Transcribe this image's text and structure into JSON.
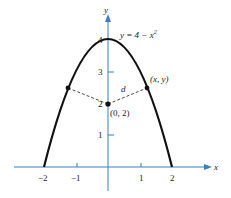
{
  "diagram": {
    "equation_label": "y = 4 − x²",
    "equation_parts": {
      "lhs": "y = 4 − x",
      "exp": "2"
    },
    "axes": {
      "x_label": "x",
      "y_label": "y",
      "x_ticks": [
        "−2",
        "−1",
        "1",
        "2"
      ],
      "y_ticks": [
        "1",
        "2",
        "3",
        "4"
      ]
    },
    "points": {
      "center_label": "(0, 2)",
      "curve_point_label": "(x, y)",
      "distance_label": "d"
    },
    "colors": {
      "axis": "#3a7fc0",
      "curve": "#111111"
    }
  }
}
